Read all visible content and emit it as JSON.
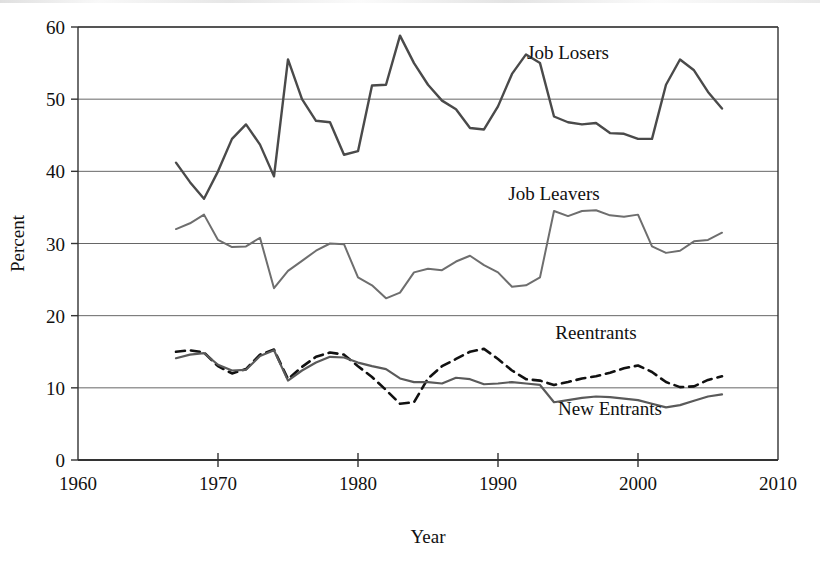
{
  "chart_data": {
    "type": "line",
    "title": "",
    "xlabel": "Year",
    "ylabel": "Percent",
    "xlim": [
      1960,
      2010
    ],
    "ylim": [
      0,
      60
    ],
    "xticks": [
      1960,
      1970,
      1980,
      1990,
      2000,
      2010
    ],
    "yticks": [
      0,
      10,
      20,
      30,
      40,
      50,
      60
    ],
    "grid": "horizontal",
    "legend_position": "inline-labels",
    "x": [
      1967,
      1968,
      1969,
      1970,
      1971,
      1972,
      1973,
      1974,
      1975,
      1976,
      1977,
      1978,
      1979,
      1980,
      1981,
      1982,
      1983,
      1984,
      1985,
      1986,
      1987,
      1988,
      1989,
      1990,
      1991,
      1992,
      1993,
      1994,
      1995,
      1996,
      1997,
      1998,
      1999,
      2000,
      2001,
      2002,
      2003,
      2004,
      2005,
      2006
    ],
    "series": [
      {
        "name": "Job Losers",
        "style": "solid",
        "color": "#4a4a4a",
        "width": 2.4,
        "label_x": 1995,
        "label_y": 55.5,
        "values": [
          41.2,
          38.5,
          36.2,
          40.0,
          44.5,
          46.5,
          43.7,
          39.3,
          55.5,
          50.0,
          47.0,
          46.8,
          42.3,
          42.8,
          51.9,
          52.0,
          58.8,
          55.0,
          52.0,
          49.8,
          48.6,
          46.0,
          45.8,
          49.0,
          53.5,
          56.2,
          55.0,
          47.6,
          46.8,
          46.5,
          46.7,
          45.3,
          45.2,
          44.5,
          44.5,
          52.0,
          55.5,
          54.0,
          51.0,
          48.7
        ]
      },
      {
        "name": "Job Leavers",
        "style": "solid",
        "color": "#6e6e6e",
        "width": 2.0,
        "label_x": 1994,
        "label_y": 36.0,
        "values": [
          32.0,
          32.8,
          34.0,
          30.5,
          29.5,
          29.6,
          30.8,
          23.8,
          26.2,
          27.6,
          29.0,
          30.0,
          29.9,
          25.3,
          24.2,
          22.4,
          23.2,
          26.0,
          26.5,
          26.3,
          27.5,
          28.3,
          27.0,
          26.0,
          24.0,
          24.2,
          25.3,
          34.5,
          33.8,
          34.5,
          34.6,
          33.9,
          33.7,
          34.0,
          29.6,
          28.7,
          29.0,
          30.3,
          30.5,
          31.5
        ]
      },
      {
        "name": "Reentrants",
        "style": "dashed",
        "color": "#111111",
        "width": 2.6,
        "label_x": 1997,
        "label_y": 16.7,
        "values": [
          15.0,
          15.2,
          14.9,
          13.0,
          12.0,
          12.6,
          14.6,
          15.3,
          11.2,
          12.9,
          14.3,
          14.9,
          14.6,
          13.0,
          11.5,
          9.7,
          7.8,
          8.0,
          11.3,
          13.0,
          14.0,
          15.0,
          15.4,
          14.0,
          12.4,
          11.2,
          11.0,
          10.4,
          10.8,
          11.3,
          11.6,
          12.1,
          12.7,
          13.1,
          12.2,
          10.8,
          10.1,
          10.2,
          11.1,
          11.6
        ]
      },
      {
        "name": "New Entrants",
        "style": "solid",
        "color": "#5a5a5a",
        "width": 2.2,
        "label_x": 1998,
        "label_y": 6.2,
        "values": [
          14.1,
          14.6,
          14.8,
          13.2,
          12.4,
          12.5,
          14.4,
          15.2,
          11.0,
          12.4,
          13.5,
          14.3,
          14.2,
          13.5,
          13.0,
          12.6,
          11.3,
          10.8,
          10.8,
          10.6,
          11.4,
          11.2,
          10.5,
          10.6,
          10.8,
          10.6,
          10.4,
          8.0,
          8.3,
          8.6,
          8.8,
          8.7,
          8.5,
          8.3,
          7.8,
          7.3,
          7.6,
          8.2,
          8.8,
          9.1
        ]
      }
    ]
  },
  "axis": {
    "ylabel": "Percent",
    "xlabel": "Year",
    "ytick_labels": [
      "0",
      "10",
      "20",
      "30",
      "40",
      "50",
      "60"
    ],
    "xtick_labels": [
      "1960",
      "1970",
      "1980",
      "1990",
      "2000",
      "2010"
    ]
  },
  "labels": {
    "job_losers": "Job Losers",
    "job_leavers": "Job Leavers",
    "reentrants": "Reentrants",
    "new_entrants": "New Entrants"
  }
}
